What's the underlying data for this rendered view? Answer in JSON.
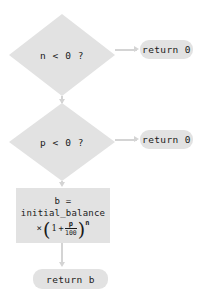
{
  "diagram": {
    "type": "flowchart",
    "colors": {
      "shape_fill": "#e2e2e2",
      "connector": "#d4d4d4",
      "text": "#1a1a1a",
      "background": "#ffffff"
    },
    "nodes": {
      "decision_n": {
        "shape": "diamond",
        "label": "n < 0 ?"
      },
      "return_zero_n": {
        "shape": "pill",
        "label": "return 0"
      },
      "decision_p": {
        "shape": "diamond",
        "label": "p < 0 ?"
      },
      "return_zero_p": {
        "shape": "pill",
        "label": "return 0"
      },
      "process_balance": {
        "shape": "rectangle",
        "line1": "b =",
        "line2": "initial_balance",
        "formula": {
          "times": "×",
          "open_paren": "(",
          "one": "1",
          "plus": "+",
          "numerator": "p",
          "denominator": "100",
          "close_paren": ")",
          "exponent": "n"
        }
      },
      "return_balance": {
        "shape": "pill",
        "label": "return b"
      }
    }
  }
}
